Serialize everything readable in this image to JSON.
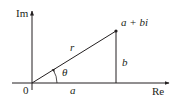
{
  "diagram": {
    "type": "complex-plane-polar-representation",
    "axes": {
      "imaginary_label": "Im",
      "real_label": "Re",
      "origin_label": "0"
    },
    "point": {
      "label": "a + bi"
    },
    "segments": {
      "radius_label": "r",
      "vertical_label": "b",
      "horizontal_label": "a"
    },
    "angle": {
      "label": "θ"
    },
    "colors": {
      "stroke": "#231f20",
      "text": "#231f20",
      "background": "#ffffff"
    }
  }
}
